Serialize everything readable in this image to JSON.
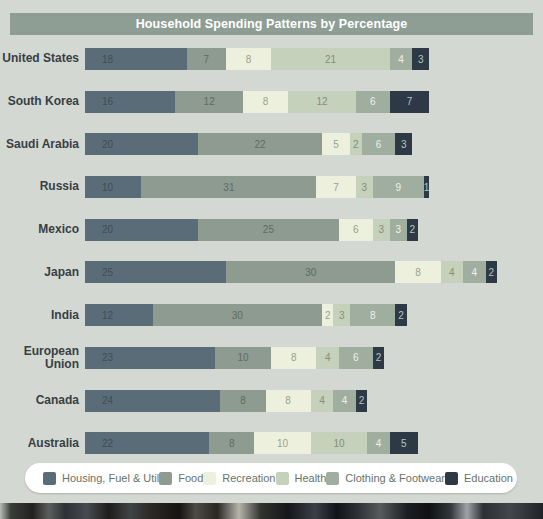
{
  "page": {
    "background": "#d3d8d2",
    "title_bar_bg": "#8f9e95",
    "title_color": "#ffffff"
  },
  "chart_data": {
    "type": "bar",
    "stacked": true,
    "orientation": "horizontal",
    "title": "Household Spending Patterns by Percentage",
    "unit": "percent",
    "xlim": [
      0,
      73
    ],
    "legend_position": "bottom",
    "value_labels": "inside",
    "categories": [
      "United States",
      "South Korea",
      "Saudi Arabia",
      "Russia",
      "Mexico",
      "Japan",
      "India",
      "European Union",
      "Canada",
      "Australia"
    ],
    "series": [
      {
        "name": "Housing, Fuel & Util",
        "color": "#5a6c78",
        "label_color": "#414d56",
        "values": [
          18,
          16,
          20,
          10,
          20,
          25,
          12,
          23,
          24,
          22
        ]
      },
      {
        "name": "Food",
        "color": "#8d9b90",
        "label_color": "#5f6b61",
        "values": [
          7,
          12,
          22,
          31,
          25,
          30,
          30,
          10,
          8,
          8
        ]
      },
      {
        "name": "Recreation",
        "color": "#edf0dc",
        "label_color": "#9aa08e",
        "values": [
          8,
          8,
          5,
          7,
          6,
          8,
          2,
          8,
          8,
          10
        ]
      },
      {
        "name": "Health",
        "color": "#c5d1bb",
        "label_color": "#848f78",
        "values": [
          21,
          12,
          2,
          3,
          3,
          4,
          3,
          4,
          4,
          10
        ]
      },
      {
        "name": "Clothing & Footwear",
        "color": "#9fae9f",
        "label_color": "#eef1ec",
        "values": [
          4,
          6,
          6,
          9,
          3,
          4,
          8,
          6,
          4,
          4
        ]
      },
      {
        "name": "Education",
        "color": "#2d3a46",
        "label_color": "#b9c1c6",
        "values": [
          3,
          7,
          3,
          1,
          2,
          2,
          2,
          2,
          2,
          5
        ]
      }
    ]
  }
}
